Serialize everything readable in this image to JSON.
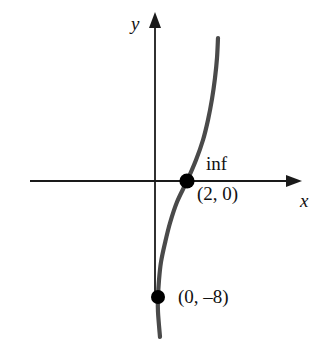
{
  "figure": {
    "kind": "cartesian-graph",
    "background_color": "#ffffff",
    "axis_color": "#1a1a1a",
    "curve_color": "#4a4a4a",
    "marker_color": "#000000",
    "text_color": "#111111"
  },
  "axes": {
    "x_axis_label": "x",
    "y_axis_label": "y",
    "x_axis_arrow": "arrow-right",
    "y_axis_arrow": "arrow-up",
    "origin_px": [
      155,
      181
    ],
    "x_axis_span_px": [
      30,
      295
    ],
    "y_axis_span_px": [
      18,
      288
    ],
    "ticks": [],
    "gridlines": false
  },
  "annotations": {
    "inflection_note": "inf",
    "inflection_point_label": "(2, 0)",
    "y_intercept_label": "(0, –8)"
  },
  "chart_data": {
    "type": "line",
    "title": "",
    "xlabel": "x",
    "ylabel": "y",
    "grid": false,
    "legend": "none",
    "series": [
      {
        "name": "cubic",
        "description": "increasing cubic curve with an inflection point on the x-axis",
        "points_px": [
          [
            160,
            337
          ],
          [
            158,
            312
          ],
          [
            158,
            297
          ],
          [
            159,
            280
          ],
          [
            161,
            262
          ],
          [
            165,
            243
          ],
          [
            170,
            223
          ],
          [
            177,
            202
          ],
          [
            187,
            181
          ],
          [
            196,
            160
          ],
          [
            203,
            140
          ],
          [
            208,
            120
          ],
          [
            212,
            99
          ],
          [
            215,
            78
          ],
          [
            217,
            58
          ],
          [
            218,
            38
          ]
        ]
      }
    ],
    "markers": [
      {
        "name": "inflection-point",
        "label": "(2, 0)",
        "x": 2,
        "y": 0,
        "px": [
          187,
          181
        ]
      },
      {
        "name": "y-intercept",
        "label": "(0, –8)",
        "x": 0,
        "y": -8,
        "px": [
          158,
          297
        ]
      }
    ]
  }
}
